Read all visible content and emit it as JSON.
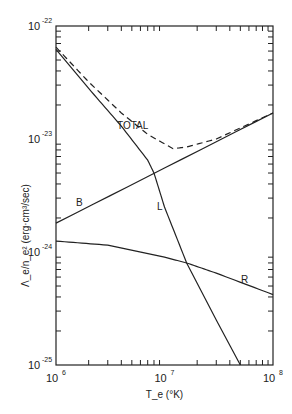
{
  "chart_data": {
    "type": "line",
    "title": "",
    "xlabel": "T_e (°K)",
    "ylabel": "Λ_e/n_e² (erg·cm³/sec)",
    "xscale": "log",
    "yscale": "log",
    "xlim": [
      1000000.0,
      100000000.0
    ],
    "ylim": [
      1e-25,
      1e-22
    ],
    "x_tick_labels": [
      "10^6",
      "10^7",
      "10^8"
    ],
    "y_tick_labels": [
      "10^-22",
      "10^-23",
      "10^-24",
      "10^-25"
    ],
    "grid": false,
    "legend": "inline labels",
    "series": [
      {
        "name": "TOTAL",
        "style": "dashed",
        "x": [
          1000000.0,
          2000000.0,
          4000000.0,
          7000000.0,
          12000000.0,
          16000000.0,
          30000000.0,
          100000000.0
        ],
        "y": [
          6.5e-23,
          3.2e-23,
          1.7e-23,
          1.1e-23,
          8.2e-24,
          8.5e-24,
          1e-23,
          1.7e-23
        ]
      },
      {
        "name": "L",
        "style": "solid",
        "x": [
          1000000.0,
          2000000.0,
          4000000.0,
          7000000.0,
          8000000.0,
          10000000.0,
          16000000.0,
          30000000.0,
          50000000.0
        ],
        "y": [
          6.2e-23,
          2.8e-23,
          1.3e-23,
          6.5e-24,
          5e-24,
          2.5e-24,
          8e-25,
          2.5e-25,
          1e-25
        ]
      },
      {
        "name": "B",
        "style": "solid",
        "x": [
          1000000.0,
          100000000.0
        ],
        "y": [
          1.8e-24,
          1.7e-23
        ]
      },
      {
        "name": "R",
        "style": "solid",
        "x": [
          1000000.0,
          3000000.0,
          10000000.0,
          16000000.0,
          30000000.0,
          100000000.0
        ],
        "y": [
          1.25e-24,
          1.15e-24,
          9e-25,
          8e-25,
          6.5e-25,
          4.2e-25
        ]
      }
    ],
    "annotations": [
      "TOTAL",
      "B",
      "L",
      "R"
    ]
  }
}
